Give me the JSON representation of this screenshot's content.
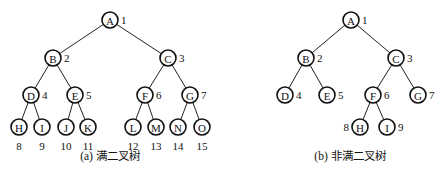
{
  "figures": [
    {
      "id": "full",
      "caption": "(a) 满二叉树",
      "caption_pos": [
        110,
        160
      ],
      "nodes": [
        {
          "id": "A",
          "label": "A",
          "num": "1",
          "x": 110,
          "y": 20,
          "np": "r"
        },
        {
          "id": "B",
          "label": "B",
          "num": "2",
          "x": 53,
          "y": 58,
          "np": "r"
        },
        {
          "id": "C",
          "label": "C",
          "num": "3",
          "x": 168,
          "y": 58,
          "np": "r"
        },
        {
          "id": "D",
          "label": "D",
          "num": "4",
          "x": 31,
          "y": 95,
          "np": "r"
        },
        {
          "id": "E",
          "label": "E",
          "num": "5",
          "x": 75,
          "y": 95,
          "np": "r"
        },
        {
          "id": "F",
          "label": "F",
          "num": "6",
          "x": 145,
          "y": 95,
          "np": "r"
        },
        {
          "id": "G",
          "label": "G",
          "num": "7",
          "x": 190,
          "y": 95,
          "np": "r"
        },
        {
          "id": "H",
          "label": "H",
          "num": "8",
          "x": 19,
          "y": 127,
          "np": "b"
        },
        {
          "id": "I",
          "label": "I",
          "num": "9",
          "x": 42,
          "y": 127,
          "np": "b"
        },
        {
          "id": "J",
          "label": "J",
          "num": "10",
          "x": 66,
          "y": 127,
          "np": "b"
        },
        {
          "id": "K",
          "label": "K",
          "num": "11",
          "x": 88,
          "y": 127,
          "np": "b"
        },
        {
          "id": "L",
          "label": "L",
          "num": "12",
          "x": 133,
          "y": 127,
          "np": "b"
        },
        {
          "id": "M",
          "label": "M",
          "num": "13",
          "x": 156,
          "y": 127,
          "np": "b"
        },
        {
          "id": "N",
          "label": "N",
          "num": "14",
          "x": 178,
          "y": 127,
          "np": "b"
        },
        {
          "id": "O",
          "label": "O",
          "num": "15",
          "x": 202,
          "y": 127,
          "np": "b"
        }
      ],
      "edges": [
        [
          "A",
          "B"
        ],
        [
          "A",
          "C"
        ],
        [
          "B",
          "D"
        ],
        [
          "B",
          "E"
        ],
        [
          "C",
          "F"
        ],
        [
          "C",
          "G"
        ],
        [
          "D",
          "H"
        ],
        [
          "D",
          "I"
        ],
        [
          "E",
          "J"
        ],
        [
          "E",
          "K"
        ],
        [
          "F",
          "L"
        ],
        [
          "F",
          "M"
        ],
        [
          "G",
          "N"
        ],
        [
          "G",
          "O"
        ]
      ]
    },
    {
      "id": "nonfull",
      "caption": "(b) 非满二叉树",
      "caption_pos": [
        350,
        160
      ],
      "nodes": [
        {
          "id": "A",
          "label": "A",
          "num": "1",
          "x": 351,
          "y": 20,
          "np": "r"
        },
        {
          "id": "B",
          "label": "B",
          "num": "2",
          "x": 306,
          "y": 58,
          "np": "r"
        },
        {
          "id": "C",
          "label": "C",
          "num": "3",
          "x": 396,
          "y": 58,
          "np": "r"
        },
        {
          "id": "D",
          "label": "D",
          "num": "4",
          "x": 285,
          "y": 95,
          "np": "r"
        },
        {
          "id": "E",
          "label": "E",
          "num": "5",
          "x": 327,
          "y": 95,
          "np": "r"
        },
        {
          "id": "F",
          "label": "F",
          "num": "6",
          "x": 373,
          "y": 95,
          "np": "r"
        },
        {
          "id": "G",
          "label": "G",
          "num": "7",
          "x": 418,
          "y": 95,
          "np": "r"
        },
        {
          "id": "H",
          "label": "H",
          "num": "8",
          "x": 360,
          "y": 127,
          "np": "l"
        },
        {
          "id": "I",
          "label": "I",
          "num": "9",
          "x": 387,
          "y": 127,
          "np": "r"
        }
      ],
      "edges": [
        [
          "A",
          "B"
        ],
        [
          "A",
          "C"
        ],
        [
          "B",
          "D"
        ],
        [
          "B",
          "E"
        ],
        [
          "C",
          "F"
        ],
        [
          "C",
          "G"
        ],
        [
          "F",
          "H"
        ],
        [
          "F",
          "I"
        ]
      ]
    }
  ],
  "style": {
    "node_radius": 8,
    "stroke_color": "#111111"
  }
}
